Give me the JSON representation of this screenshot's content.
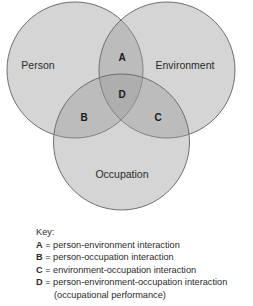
{
  "diagram": {
    "type": "venn",
    "circles": [
      {
        "id": "person",
        "label": "Person",
        "cx": 75,
        "cy": 70,
        "r": 68
      },
      {
        "id": "environment",
        "label": "Environment",
        "cx": 167,
        "cy": 70,
        "r": 68
      },
      {
        "id": "occupation",
        "label": "Occupation",
        "cx": 121.5,
        "cy": 142,
        "r": 68
      }
    ],
    "regions": [
      {
        "letter": "A",
        "x": 122,
        "y": 57
      },
      {
        "letter": "B",
        "x": 84,
        "y": 117
      },
      {
        "letter": "C",
        "x": 158,
        "y": 117
      },
      {
        "letter": "D",
        "x": 122,
        "y": 94
      }
    ],
    "colors": {
      "fill": "#d4d4d4",
      "fill_opacity": 0.55,
      "stroke": "#6e6e6e"
    }
  },
  "key": {
    "title": "Key:",
    "items": [
      {
        "letter": "A",
        "text": " = person-environment interaction"
      },
      {
        "letter": "B",
        "text": " = person-occupation interaction"
      },
      {
        "letter": "C",
        "text": " = environment-occupation interaction"
      },
      {
        "letter": "D",
        "text": " = person-environment-occupation interaction"
      }
    ],
    "continuation": "(occupational performance)"
  }
}
